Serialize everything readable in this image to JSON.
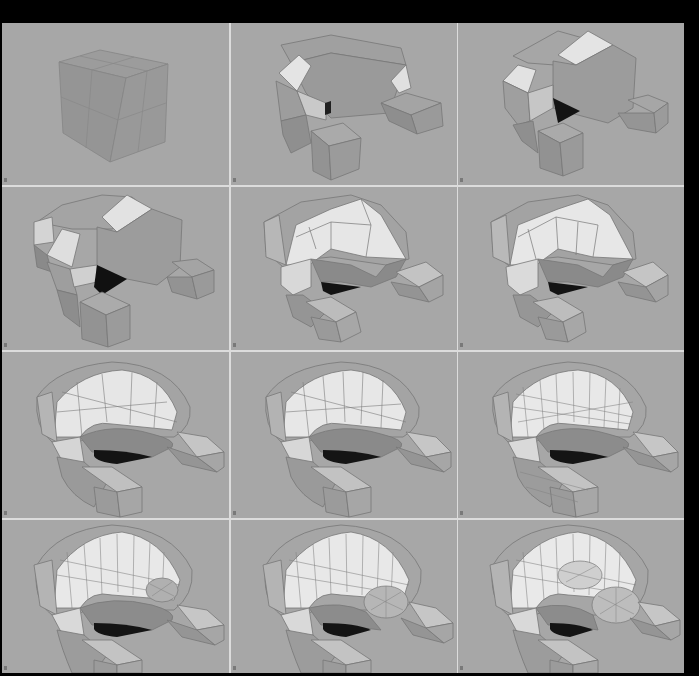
{
  "figure": {
    "layout": {
      "rows": 4,
      "cols": 3
    },
    "colors": {
      "frame": "#000000",
      "divider": "#dcdcdc",
      "viewport_bg": "#a7a7a7",
      "face_light": "#e6e6e6",
      "face_mid": "#bdbdbd",
      "face_base": "#9a9a9a",
      "face_dark": "#7a7a7a",
      "cavity": "#141414",
      "edge": "#6a6a6a"
    },
    "panels": [
      {
        "step": 1,
        "stage": "cube-subdivided"
      },
      {
        "step": 2,
        "stage": "extruded-loop-and-limbs"
      },
      {
        "step": 3,
        "stage": "bevelled-body"
      },
      {
        "step": 4,
        "stage": "refined-body"
      },
      {
        "step": 5,
        "stage": "rounded-shell"
      },
      {
        "step": 6,
        "stage": "rounded-shell-refined"
      },
      {
        "step": 7,
        "stage": "smoothed-shell"
      },
      {
        "step": 8,
        "stage": "smoothed-shell-refined"
      },
      {
        "step": 9,
        "stage": "dense-mesh"
      },
      {
        "step": 10,
        "stage": "detail-start"
      },
      {
        "step": 11,
        "stage": "detail-mid"
      },
      {
        "step": 12,
        "stage": "detail-final"
      }
    ]
  }
}
